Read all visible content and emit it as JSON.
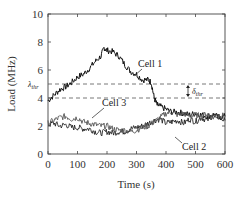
{
  "chart_data": {
    "type": "line",
    "title": "",
    "xlabel": "Time (s)",
    "ylabel": "Load (MHz)",
    "xlim": [
      0,
      600
    ],
    "ylim": [
      0,
      10
    ],
    "xticks": [
      0,
      100,
      200,
      300,
      400,
      500,
      600
    ],
    "yticks": [
      0,
      2,
      4,
      6,
      8,
      10
    ],
    "grid": false,
    "legend": "none (inline annotations)",
    "series": [
      {
        "name": "Cell 1",
        "x": [
          0,
          20,
          40,
          60,
          80,
          100,
          120,
          140,
          160,
          180,
          190,
          200,
          220,
          240,
          260,
          280,
          300,
          320,
          340,
          350,
          360,
          370,
          380,
          400,
          420,
          440,
          460,
          480,
          500,
          520,
          540,
          560,
          580,
          600
        ],
        "values": [
          3.8,
          4.2,
          4.6,
          4.8,
          5.1,
          5.5,
          5.7,
          6.1,
          6.6,
          7.0,
          7.6,
          7.4,
          7.3,
          7.0,
          6.4,
          5.9,
          5.7,
          5.3,
          5.3,
          5.1,
          4.0,
          3.5,
          3.4,
          3.2,
          3.0,
          3.0,
          2.9,
          2.8,
          2.9,
          2.8,
          2.7,
          2.8,
          2.6,
          2.7
        ]
      },
      {
        "name": "Cell 2",
        "x": [
          0,
          20,
          40,
          60,
          80,
          100,
          120,
          140,
          160,
          180,
          200,
          220,
          240,
          260,
          280,
          300,
          320,
          340,
          360,
          380,
          400,
          420,
          440,
          460,
          480,
          500,
          520,
          540,
          560,
          580,
          600
        ],
        "values": [
          2.1,
          2.2,
          2.0,
          2.1,
          1.9,
          1.9,
          1.8,
          1.8,
          1.6,
          1.5,
          1.6,
          1.5,
          1.6,
          1.6,
          1.8,
          1.9,
          2.0,
          2.2,
          2.4,
          2.5,
          2.2,
          2.3,
          2.4,
          2.2,
          2.5,
          2.3,
          2.6,
          2.4,
          2.8,
          2.6,
          2.4
        ]
      },
      {
        "name": "Cell 3",
        "x": [
          0,
          20,
          40,
          60,
          80,
          100,
          120,
          140,
          160,
          180,
          200,
          220,
          240,
          260,
          280,
          300,
          320,
          340,
          360,
          380,
          400,
          420,
          440,
          460,
          480,
          500,
          520,
          540,
          560,
          580,
          600
        ],
        "values": [
          2.2,
          2.4,
          2.6,
          2.7,
          2.5,
          2.6,
          2.3,
          2.2,
          2.1,
          2.0,
          2.0,
          1.8,
          1.7,
          1.7,
          1.6,
          1.7,
          1.9,
          2.0,
          2.3,
          2.6,
          2.9,
          3.0,
          2.8,
          2.9,
          2.7,
          2.8,
          2.7,
          2.9,
          2.6,
          2.8,
          2.7
        ]
      }
    ],
    "reference_lines": [
      {
        "label": "λ_thr",
        "y": 5.0,
        "style": "dashed"
      },
      {
        "label": "",
        "y": 4.0,
        "style": "dashed"
      }
    ],
    "annotations": [
      {
        "text": "Cell 1",
        "x": 250,
        "y": 5.9
      },
      {
        "text": "Cell 3",
        "x": 115,
        "y": 3.4
      },
      {
        "text": "Cell 2",
        "x": 430,
        "y": 0.6
      },
      {
        "text": "δ_thr",
        "x": 560,
        "y": 4.5,
        "type": "double-arrow between 4 and 5"
      }
    ]
  },
  "labels": {
    "xlabel": "Time (s)",
    "ylabel": "Load (MHz)",
    "lambda_thr": "λ",
    "lambda_sub": "thr",
    "delta_thr": "δ",
    "delta_sub": "thr",
    "cell1": "Cell 1",
    "cell2": "Cell 2",
    "cell3": "Cell 3"
  }
}
